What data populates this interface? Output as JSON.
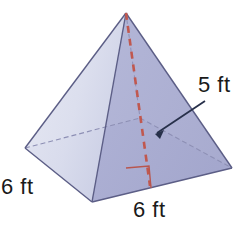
{
  "figure": {
    "name": "square-pyramid",
    "background_color": "#ffffff"
  },
  "labels": {
    "slant_height": "5 ft",
    "base_edge_left": "6 ft",
    "base_edge_front": "6 ft"
  },
  "colors": {
    "face_left": "#dcdfee",
    "face_front_left": "#b9bcdc",
    "face_front_right": "#a9acd2",
    "face_right": "#b2b5d8",
    "base_top": "#b0b4d8",
    "edge_stroke": "#55567e",
    "hidden_edge_stroke": "#8b8db3",
    "altitude_dash": "#c05a52",
    "right_angle_mark": "#b8564e",
    "leader_line": "#27304a",
    "text": "#1a1a1a"
  },
  "geometry": {
    "apex": [
      126,
      13
    ],
    "base_left": [
      25,
      148
    ],
    "base_front": [
      92,
      202
    ],
    "base_right": [
      232,
      168
    ],
    "base_back": [
      140,
      118
    ],
    "base_center": [
      150,
      185
    ],
    "altitude_foot": [
      150,
      185
    ],
    "leader_arrow_tip": [
      156,
      133
    ],
    "leader_anchor": [
      204,
      101
    ],
    "right_angle_square": [
      126,
      168,
      24,
      22
    ]
  },
  "annotations": {
    "altitude_style": "dashed",
    "hidden_edges_style": "dashed",
    "slant_height_value": 5,
    "base_edge_value": 6,
    "units": "ft"
  }
}
